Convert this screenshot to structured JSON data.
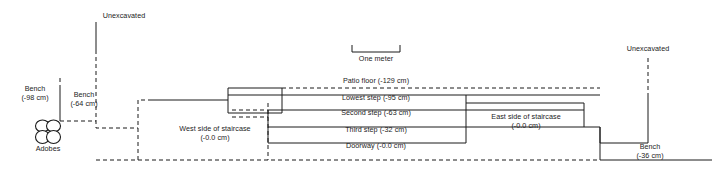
{
  "figure": {
    "type": "archaeological-plan-cross-section",
    "scale_bar": {
      "label": "One meter",
      "x_start": 352,
      "x_end": 400
    },
    "annotations": {
      "unexcavated_left": "Unexcavated",
      "unexcavated_right": "Unexcavated",
      "adobes": "Adobes"
    },
    "benches": [
      {
        "name": "bench-left-outer",
        "label": "Bench",
        "depth": "(-98 cm)"
      },
      {
        "name": "bench-left-inner",
        "label": "Bench",
        "depth": "(-64 cm)"
      },
      {
        "name": "bench-right",
        "label": "Bench",
        "depth": "(-36 cm)"
      }
    ],
    "staircase_sides": [
      {
        "name": "west-side-of-staircase",
        "label": "West side of staircase",
        "depth": "(-0.0 cm)"
      },
      {
        "name": "east-side-of-staircase",
        "label": "East side of staircase",
        "depth": "(-0.0 cm)"
      }
    ],
    "steps": [
      {
        "name": "patio-floor",
        "label": "Patio floor (-129 cm)"
      },
      {
        "name": "lowest-step",
        "label": "Lowest step (-95 cm)"
      },
      {
        "name": "second-step",
        "label": "Second step (-63 cm)"
      },
      {
        "name": "third-step",
        "label": "Third step (-32 cm)"
      },
      {
        "name": "doorway",
        "label": "Doorway (-0.0 cm)"
      }
    ]
  },
  "colors": {
    "ink": "#1b1b1b",
    "paper": "#ffffff"
  }
}
